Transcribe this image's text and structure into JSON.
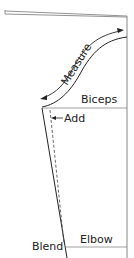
{
  "diagram": {
    "type": "sleeve-pattern-draft",
    "labels": {
      "measure": "Measure",
      "biceps": "Biceps",
      "add": "Add",
      "blend": "Blend",
      "elbow": "Elbow"
    },
    "colors": {
      "line": "#222222",
      "guide": "#888888",
      "background": "#ffffff"
    }
  }
}
